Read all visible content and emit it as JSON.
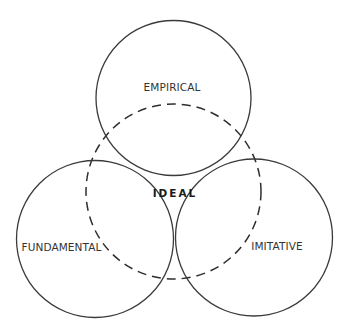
{
  "diagram": {
    "type": "venn",
    "circles": [
      {
        "id": "empirical",
        "label": "EMPIRICAL",
        "style": "solid"
      },
      {
        "id": "fundamental",
        "label": "FUNDAMENTAL",
        "style": "solid"
      },
      {
        "id": "imitative",
        "label": "IMITATIVE",
        "style": "solid"
      },
      {
        "id": "ideal",
        "label": "IDEAL",
        "style": "dashed"
      }
    ],
    "labels": {
      "empirical": "EMPIRICAL",
      "fundamental": "FUNDAMENTAL",
      "imitative": "IMITATIVE",
      "ideal": "IDEAL"
    },
    "colors": {
      "stroke": "#3a3a3a",
      "text": "#333333",
      "background": "#ffffff"
    }
  }
}
